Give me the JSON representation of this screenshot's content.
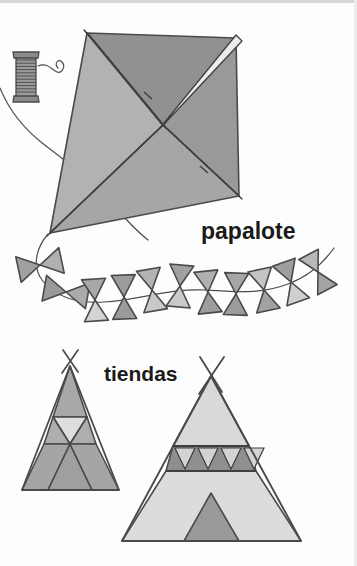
{
  "page": {
    "background_color": "#fdfdfd",
    "width": 357,
    "height": 566,
    "top_border_color": "#cfcfcf",
    "right_border_color": "#e6e6e6"
  },
  "labels": {
    "kite": "papalote",
    "tents": "tiendas"
  },
  "palette": {
    "outline": "#4a4a4a",
    "dark_gray": "#8d8d8d",
    "mid_gray": "#a3a3a3",
    "light_gray": "#c9c9c9",
    "pale_gray": "#dcdcdc",
    "very_light": "#e4e4e4",
    "spool_fill": "#9a9a9a",
    "string": "#4d4d4d",
    "text": "#1a1a1a"
  },
  "illustration": {
    "kite": {
      "name": "papalote",
      "vertices": {
        "top": [
          87,
          33
        ],
        "right": [
          236,
          38
        ],
        "bottom": [
          239,
          196
        ],
        "left": [
          50,
          233
        ]
      },
      "center": [
        163,
        125
      ],
      "panels": [
        {
          "id": "top-left",
          "fill": "#adadad"
        },
        {
          "id": "top-right",
          "fill": "#8f8f8f"
        },
        {
          "id": "bottom-left",
          "fill": "#b4b4b4"
        },
        {
          "id": "bottom-right",
          "fill": "#999999"
        }
      ],
      "spar_fill": "#e9e9e9",
      "bridle_knot": [
        99,
        128
      ]
    },
    "spool": {
      "name": "string-spool",
      "x": 14,
      "y": 52,
      "width": 24,
      "height": 50,
      "winding_lines": 12,
      "fill": "#9a9a9a",
      "cap_fill": "#8a8a8a"
    },
    "tail": {
      "name": "kite-tail",
      "bow_count": 11,
      "bows": [
        {
          "cx": 40,
          "cy": 265,
          "rot": -12,
          "left_fill": "#a0a0a0",
          "right_fill": "#b0b0b0",
          "scale": 1.0
        },
        {
          "cx": 66,
          "cy": 292,
          "rot": 10,
          "left_fill": "#9a9a9a",
          "right_fill": "#ababab",
          "scale": 1.0
        },
        {
          "cx": 95,
          "cy": 300,
          "rot": -4,
          "left_fill": "#a8a8a8",
          "right_fill": "#d2d2d2",
          "scale": 0.95
        },
        {
          "cx": 122,
          "cy": 296,
          "rot": 2,
          "left_fill": "#9c9c9c",
          "right_fill": "#9a9a9a",
          "scale": 1.0
        },
        {
          "cx": 150,
          "cy": 290,
          "rot": -6,
          "left_fill": "#b4b4b4",
          "right_fill": "#c7c7c7",
          "scale": 1.0
        },
        {
          "cx": 178,
          "cy": 287,
          "rot": 4,
          "left_fill": "#a1a1a1",
          "right_fill": "#c9c9c9",
          "scale": 1.0
        },
        {
          "cx": 206,
          "cy": 291,
          "rot": -3,
          "left_fill": "#b0b0b0",
          "right_fill": "#9d9d9d",
          "scale": 1.0
        },
        {
          "cx": 233,
          "cy": 296,
          "rot": 5,
          "left_fill": "#a6a6a6",
          "right_fill": "#9b9b9b",
          "scale": 1.0
        },
        {
          "cx": 261,
          "cy": 293,
          "rot": -5,
          "left_fill": "#c4c4c4",
          "right_fill": "#a2a2a2",
          "scale": 1.0
        },
        {
          "cx": 289,
          "cy": 285,
          "rot": 8,
          "left_fill": "#9e9e9e",
          "right_fill": "#cfcfcf",
          "scale": 1.0
        },
        {
          "cx": 316,
          "cy": 274,
          "rot": -10,
          "left_fill": "#b8b8b8",
          "right_fill": "#a4a4a4",
          "scale": 0.95
        }
      ]
    },
    "tent_left": {
      "name": "tent-left",
      "apex": [
        70,
        366
      ],
      "base_left": [
        22,
        490
      ],
      "base_right": [
        119,
        490
      ],
      "band_y1": 417,
      "band_y2": 444,
      "pole_overhang": 14,
      "fills": {
        "upper": "#a8a8a8",
        "band_side": "#aeaeae",
        "band_center": "#dedede",
        "lower": "#a5a5a5",
        "door": "#9f9f9f"
      }
    },
    "tent_right": {
      "name": "tent-right",
      "apex": [
        211,
        376
      ],
      "base_left": [
        122,
        541
      ],
      "base_right": [
        301,
        541
      ],
      "band_y1": 446,
      "band_y2": 471,
      "band_triangle_count": 4,
      "pole_overhang": 18,
      "fills": {
        "upper": "#d9d9d9",
        "band": "#8f8f8f",
        "band_triangle": "#d3d3d3",
        "lower": "#dcdcdc",
        "door": "#9a9a9a"
      },
      "door": {
        "apex": [
          211,
          493
        ],
        "base_left": [
          184,
          541
        ],
        "base_right": [
          239,
          541
        ]
      }
    }
  }
}
